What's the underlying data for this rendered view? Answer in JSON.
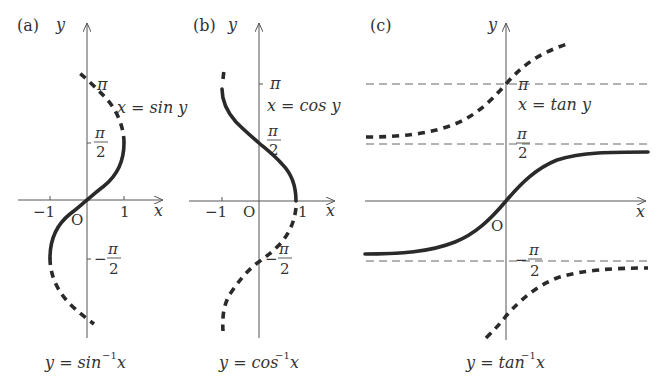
{
  "panels": [
    {
      "label": "(a)",
      "axis_x": "x",
      "axis_y": "y",
      "origin": "O",
      "ticks_x": [
        "−1",
        "1"
      ],
      "tick_pi": "π",
      "tick_half_num": "π",
      "tick_half_den": "2",
      "tick_neg_half_sign": "−",
      "curve_label": "x = sin y",
      "caption_main": "y = sin",
      "caption_sup": "−1",
      "caption_var": "x"
    },
    {
      "label": "(b)",
      "axis_x": "x",
      "axis_y": "y",
      "origin": "O",
      "ticks_x": [
        "−1",
        "1"
      ],
      "tick_pi": "π",
      "tick_half_num": "π",
      "tick_half_den": "2",
      "tick_neg_half_sign": "−",
      "curve_label": "x = cos y",
      "caption_main": "y = cos",
      "caption_sup": "−1",
      "caption_var": "x"
    },
    {
      "label": "(c)",
      "axis_x": "x",
      "axis_y": "y",
      "origin": "O",
      "tick_pi": "π",
      "tick_half_num": "π",
      "tick_half_den": "2",
      "tick_neg_half_sign": "−",
      "curve_label": "x = tan y",
      "caption_main": "y = tan",
      "caption_sup": "−1",
      "caption_var": "x"
    }
  ],
  "colors": {
    "curve": "#2a2a2a",
    "axis": "#555555",
    "text": "#333333",
    "background": "#ffffff"
  }
}
